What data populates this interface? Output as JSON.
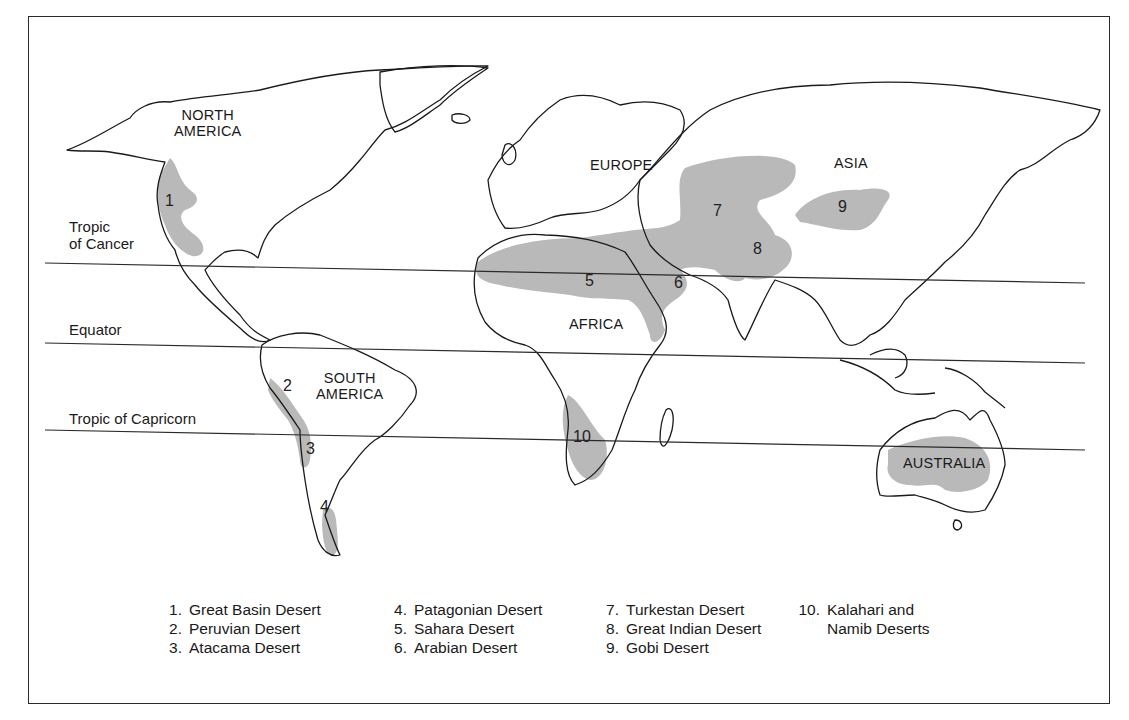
{
  "map": {
    "lines": [
      {
        "id": "tropic_of_cancer",
        "label": "Tropic of Cancer",
        "label_lines": [
          "Tropic",
          "of Cancer"
        ]
      },
      {
        "id": "equator",
        "label": "Equator"
      },
      {
        "id": "tropic_of_capricorn",
        "label": "Tropic of Capricorn"
      }
    ],
    "continents": {
      "north_america": [
        "NORTH",
        "AMERICA"
      ],
      "south_america": [
        "SOUTH",
        "AMERICA"
      ],
      "europe": "EUROPE",
      "africa": "AFRICA",
      "asia": "ASIA",
      "australia": "AUSTRALIA"
    },
    "desert_numbers": [
      "1",
      "2",
      "3",
      "4",
      "5",
      "6",
      "7",
      "8",
      "9",
      "10"
    ],
    "colors": {
      "desert_fill": "#b9b9b9",
      "outline": "#1a1a1a",
      "background": "#ffffff"
    }
  },
  "legend": {
    "items": [
      {
        "num": "1.",
        "name": "Great Basin Desert"
      },
      {
        "num": "2.",
        "name": "Peruvian Desert"
      },
      {
        "num": "3.",
        "name": "Atacama Desert"
      },
      {
        "num": "4.",
        "name": "Patagonian Desert"
      },
      {
        "num": "5.",
        "name": "Sahara Desert"
      },
      {
        "num": "6.",
        "name": "Arabian Desert"
      },
      {
        "num": "7.",
        "name": "Turkestan Desert"
      },
      {
        "num": "8.",
        "name": "Great Indian Desert"
      },
      {
        "num": "9.",
        "name": "Gobi Desert"
      },
      {
        "num": "10.",
        "name": "Kalahari and",
        "name2": "Namib Deserts"
      }
    ]
  }
}
